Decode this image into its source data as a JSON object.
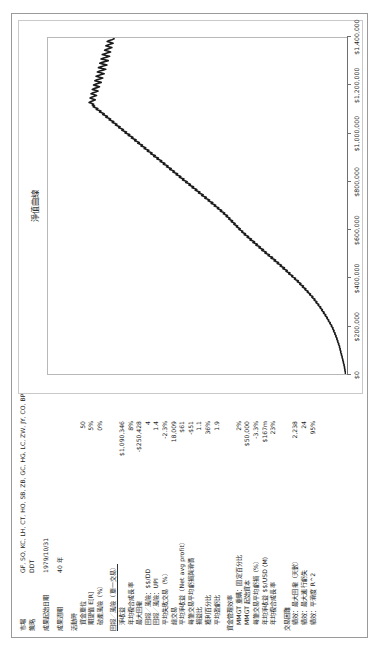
{
  "report": {
    "rows": [
      {
        "label": "市場",
        "value": "GF, SO, KC, LH, CT, HO, SB, ZB, GC, HG, LC, ZW, JY, CO, BP, SV, SP, TY, CL, FV, NG, ND, EC, YM",
        "kind": "wide"
      },
      {
        "label": "策略",
        "value": "DDT",
        "kind": "wide"
      },
      {
        "label": "",
        "value": "",
        "kind": "gap"
      },
      {
        "label": "成果起始日期",
        "value": "1979/10/31",
        "kind": "wide"
      },
      {
        "label": "",
        "value": "",
        "kind": "gap"
      },
      {
        "label": "成果週期",
        "value": "40 年",
        "kind": "wide"
      },
      {
        "label": "",
        "value": "",
        "kind": "gap"
      },
      {
        "label": "活動時",
        "value": "",
        "kind": "head"
      },
      {
        "label": "資金單位",
        "value": "50",
        "kind": "ind"
      },
      {
        "label": "期望值 E[R]",
        "value": "5%",
        "kind": "ind"
      },
      {
        "label": "破產風險（%）",
        "value": "0%",
        "kind": "ind"
      },
      {
        "label": "",
        "value": "",
        "kind": "gap"
      },
      {
        "label": "回報／風險（單一交易）",
        "value": "",
        "kind": "head-underline"
      },
      {
        "label": "淨收益",
        "value": "$1,090,346",
        "kind": "ind"
      },
      {
        "label": "年均複合成長率",
        "value": "8%",
        "kind": "ind"
      },
      {
        "label": "最大回撤",
        "value": "-$250,428",
        "kind": "ind"
      },
      {
        "label": "回報／風險：$$/DD",
        "value": "4",
        "kind": "ind"
      },
      {
        "label": "回報／風險：UPI",
        "value": "1.4",
        "kind": "ind"
      },
      {
        "label": "平均失敗交易（%）",
        "value": "-2.3%",
        "kind": "ind"
      },
      {
        "label": "總交易",
        "value": "18,009",
        "kind": "ind"
      },
      {
        "label": "平均淨收益（Net avg profit）",
        "value": "$61",
        "kind": "ind"
      },
      {
        "label": "每筆交易平均虧損與滑價",
        "value": "-$51",
        "kind": "ind"
      },
      {
        "label": "損益比",
        "value": "1.1",
        "kind": "ind"
      },
      {
        "label": "獲利百分比",
        "value": "36%",
        "kind": "ind"
      },
      {
        "label": "平均盈虧比",
        "value": "1.9",
        "kind": "ind"
      },
      {
        "label": "",
        "value": "",
        "kind": "gap"
      },
      {
        "label": "資金管理效率",
        "value": "",
        "kind": "head"
      },
      {
        "label": "MMGT 重購：固定百分比",
        "value": "2%",
        "kind": "ind"
      },
      {
        "label": "MMGT 起始資本",
        "value": "$50,000",
        "kind": "ind"
      },
      {
        "label": "每筆交易平均虧損（%）",
        "value": "-3.3%",
        "kind": "ind"
      },
      {
        "label": "年均淨收益 $$/USD (M)",
        "value": "$167m",
        "kind": "ind"
      },
      {
        "label": "年均複合成長率",
        "value": "23%",
        "kind": "ind"
      },
      {
        "label": "",
        "value": "",
        "kind": "gap"
      },
      {
        "label": "交易困難",
        "value": "",
        "kind": "head"
      },
      {
        "label": "績效：最大回撤（天數）",
        "value": "2,238",
        "kind": "ind"
      },
      {
        "label": "績效：最大連行虧失",
        "value": "24",
        "kind": "ind"
      },
      {
        "label": "績效：平滑度 R^2",
        "value": "95%",
        "kind": "ind"
      }
    ]
  },
  "chart_data": {
    "type": "line",
    "title": "淨值曲線",
    "xlabel": "",
    "ylabel": "",
    "ylim": [
      0,
      1400000
    ],
    "grid": false,
    "legend": null,
    "yticks": [
      0,
      200000,
      400000,
      600000,
      800000,
      1000000,
      1200000,
      1400000
    ],
    "ytick_labels": [
      "$0",
      "$200,000",
      "$400,000",
      "$600,000",
      "$800,000",
      "$1,000,000",
      "$1,200,000",
      "$1,400,000"
    ],
    "line_color": "#1a1a1a",
    "series": [
      {
        "name": "淨值曲線",
        "values": [
          2000,
          3000,
          2500,
          4000,
          5200,
          4800,
          6000,
          7200,
          6800,
          8000,
          9500,
          9000,
          11000,
          12500,
          12000,
          14000,
          15500,
          15000,
          17000,
          18500,
          18000,
          20000,
          22000,
          21000,
          23500,
          25000,
          24000,
          26500,
          28000,
          27000,
          29500,
          31000,
          30000,
          33000,
          35000,
          34000,
          37000,
          39500,
          38000,
          41000,
          43500,
          42000,
          45000,
          48000,
          46500,
          50000,
          53000,
          51000,
          55000,
          58000,
          56000,
          60000,
          63000,
          61000,
          66000,
          69000,
          67000,
          72000,
          76000,
          74000,
          79000,
          83000,
          81000,
          86000,
          90000,
          88000,
          93000,
          98000,
          95000,
          101000,
          106000,
          103000,
          109000,
          114000,
          111000,
          117000,
          122000,
          119000,
          126000,
          131000,
          128000,
          135000,
          141000,
          137000,
          144000,
          150000,
          146000,
          154000,
          160000,
          156000,
          164000,
          171000,
          167000,
          175000,
          182000,
          178000,
          186000,
          193000,
          189000,
          198000,
          205000,
          200000,
          209000,
          217000,
          212000,
          221000,
          229000,
          224000,
          234000,
          242000,
          237000,
          247000,
          255000,
          250000,
          260000,
          269000,
          263000,
          273000,
          282000,
          276000,
          286000,
          296000,
          289000,
          299000,
          309000,
          303000,
          313000,
          323000,
          317000,
          327000,
          338000,
          331000,
          341000,
          352000,
          345000,
          356000,
          366000,
          360000,
          370000,
          381000,
          374000,
          384000,
          395000,
          388000,
          398000,
          409000,
          402000,
          412000,
          423000,
          416000,
          426000,
          437000,
          430000,
          440000,
          451000,
          444000,
          454000,
          464000,
          458000,
          468000,
          478000,
          472000,
          481000,
          490000,
          485000,
          494000,
          503000,
          497000,
          506000,
          515000,
          509000,
          518000,
          527000,
          521000,
          530000,
          539000,
          533000,
          542000,
          551000,
          545000,
          554000,
          563000,
          557000,
          566000,
          576000,
          570000,
          580000,
          590000,
          584000,
          594000,
          604000,
          598000,
          608000,
          619000,
          612000,
          622000,
          633000,
          626000,
          637000,
          648000,
          641000,
          652000,
          663000,
          656000,
          667000,
          678000,
          671000,
          682000,
          693000,
          686000,
          697000,
          708000,
          701000,
          712000,
          723000,
          716000,
          727000,
          738000,
          731000,
          742000,
          753000,
          746000,
          757000,
          768000,
          761000,
          772000,
          783000,
          776000,
          787000,
          798000,
          791000,
          802000,
          813000,
          806000,
          817000,
          828000,
          821000,
          832000,
          843000,
          836000,
          847000,
          858000,
          851000,
          862000,
          873000,
          866000,
          877000,
          888000,
          881000,
          892000,
          903000,
          896000,
          907000,
          918000,
          911000,
          922000,
          933000,
          926000,
          937000,
          948000,
          941000,
          952000,
          963000,
          956000,
          967000,
          978000,
          971000,
          982000,
          993000,
          986000,
          997000,
          1008000,
          1001000,
          1012000,
          1023000,
          1016000,
          1027000,
          1038000,
          1031000,
          1042000,
          1053000,
          1046000,
          1057000,
          1068000,
          1061000,
          1072000,
          1083000,
          1076000,
          1087000,
          1098000,
          1091000,
          1102000,
          1113000,
          1106000,
          1117000,
          1128000,
          1121000,
          1132000,
          1143000,
          1136000,
          1147000,
          1158000,
          1151000,
          1162000,
          1173000,
          1166000,
          1177000,
          1188000,
          1181000,
          1192000,
          1185000,
          1196000,
          1207000,
          1198000,
          1188000,
          1178000,
          1190000,
          1202000,
          1195000,
          1183000,
          1172000,
          1185000,
          1198000,
          1188000,
          1176000,
          1165000,
          1178000,
          1192000,
          1183000,
          1170000,
          1158000,
          1172000,
          1186000,
          1176000,
          1163000,
          1150000,
          1165000,
          1180000,
          1170000,
          1156000,
          1143000,
          1158000,
          1174000,
          1163000,
          1149000,
          1136000,
          1152000,
          1168000,
          1157000,
          1143000,
          1129000,
          1146000,
          1163000,
          1151000,
          1137000,
          1123000,
          1140000,
          1157000,
          1145000,
          1131000,
          1117000,
          1134000,
          1151000,
          1139000,
          1125000,
          1111000,
          1128000,
          1145000,
          1133000,
          1119000,
          1106000,
          1120000,
          1134000,
          1124000,
          1112000,
          1100000,
          1114000,
          1128000,
          1118000,
          1106000,
          1094000,
          1108000,
          1122000,
          1112000,
          1100000,
          1090000,
          1090346
        ]
      }
    ]
  }
}
